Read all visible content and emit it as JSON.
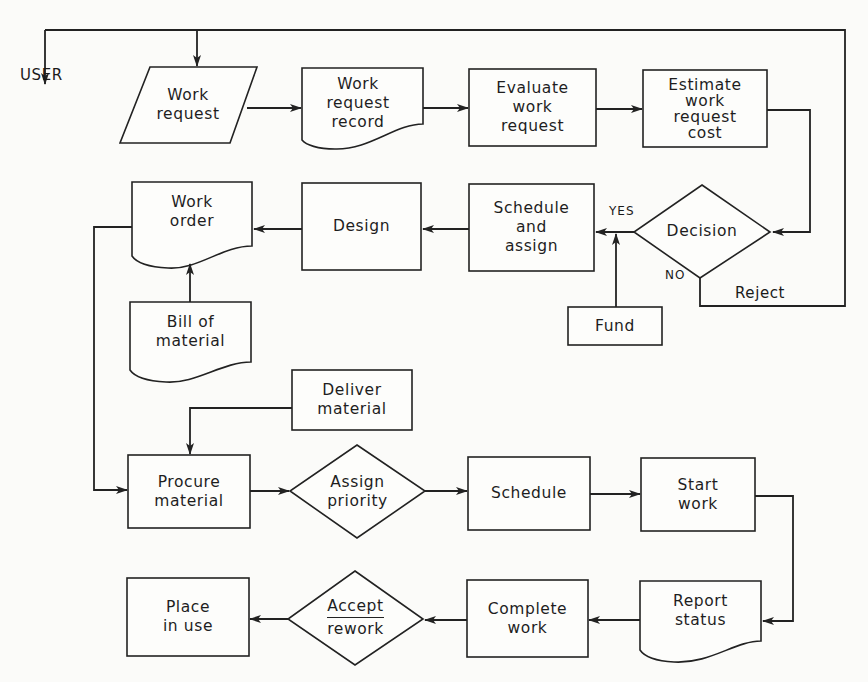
{
  "diagram": {
    "type": "flowchart",
    "external_entity": "USER",
    "nodes": [
      {
        "id": "work_request",
        "shape": "parallelogram",
        "lines": [
          "Work",
          "request"
        ]
      },
      {
        "id": "work_request_record",
        "shape": "document",
        "lines": [
          "Work",
          "request",
          "record"
        ]
      },
      {
        "id": "evaluate",
        "shape": "process",
        "lines": [
          "Evaluate",
          "work",
          "request"
        ]
      },
      {
        "id": "estimate",
        "shape": "process",
        "lines": [
          "Estimate",
          "work",
          "request",
          "cost"
        ]
      },
      {
        "id": "decision",
        "shape": "decision",
        "lines": [
          "Decision"
        ]
      },
      {
        "id": "schedule_assign",
        "shape": "process",
        "lines": [
          "Schedule",
          "and",
          "assign"
        ]
      },
      {
        "id": "fund",
        "shape": "process",
        "lines": [
          "Fund"
        ]
      },
      {
        "id": "design",
        "shape": "process",
        "lines": [
          "Design"
        ]
      },
      {
        "id": "work_order",
        "shape": "document",
        "lines": [
          "Work",
          "order"
        ]
      },
      {
        "id": "bill_of_material",
        "shape": "document",
        "lines": [
          "Bill of",
          "material"
        ]
      },
      {
        "id": "deliver_material",
        "shape": "process",
        "lines": [
          "Deliver",
          "material"
        ]
      },
      {
        "id": "procure_material",
        "shape": "process",
        "lines": [
          "Procure",
          "material"
        ]
      },
      {
        "id": "assign_priority",
        "shape": "decision",
        "lines": [
          "Assign",
          "priority"
        ]
      },
      {
        "id": "schedule",
        "shape": "process",
        "lines": [
          "Schedule"
        ]
      },
      {
        "id": "start_work",
        "shape": "process",
        "lines": [
          "Start",
          "work"
        ]
      },
      {
        "id": "report_status",
        "shape": "document",
        "lines": [
          "Report",
          "status"
        ]
      },
      {
        "id": "complete_work",
        "shape": "process",
        "lines": [
          "Complete",
          "work"
        ]
      },
      {
        "id": "accept_rework",
        "shape": "decision",
        "lines": [
          "Accept",
          "rework"
        ]
      },
      {
        "id": "place_in_use",
        "shape": "process",
        "lines": [
          "Place",
          "in use"
        ]
      }
    ],
    "edge_labels": {
      "yes": "YES",
      "no": "NO",
      "reject": "Reject"
    },
    "edges": [
      {
        "from": "top_feedback_line",
        "to": "USER"
      },
      {
        "from": "top_feedback_line",
        "to": "work_request"
      },
      {
        "from": "work_request",
        "to": "work_request_record"
      },
      {
        "from": "work_request_record",
        "to": "evaluate"
      },
      {
        "from": "evaluate",
        "to": "estimate"
      },
      {
        "from": "estimate",
        "to": "decision"
      },
      {
        "from": "decision",
        "to": "schedule_assign",
        "label": "YES"
      },
      {
        "from": "decision",
        "to": "top_feedback_line",
        "label": "NO / Reject"
      },
      {
        "from": "fund",
        "to": "schedule_assign"
      },
      {
        "from": "schedule_assign",
        "to": "design"
      },
      {
        "from": "design",
        "to": "work_order"
      },
      {
        "from": "bill_of_material",
        "to": "work_order"
      },
      {
        "from": "work_order",
        "to": "procure_material"
      },
      {
        "from": "deliver_material",
        "to": "procure_material"
      },
      {
        "from": "procure_material",
        "to": "assign_priority"
      },
      {
        "from": "assign_priority",
        "to": "schedule"
      },
      {
        "from": "schedule",
        "to": "start_work"
      },
      {
        "from": "start_work",
        "to": "report_status"
      },
      {
        "from": "report_status",
        "to": "complete_work"
      },
      {
        "from": "complete_work",
        "to": "accept_rework"
      },
      {
        "from": "accept_rework",
        "to": "place_in_use"
      }
    ]
  }
}
